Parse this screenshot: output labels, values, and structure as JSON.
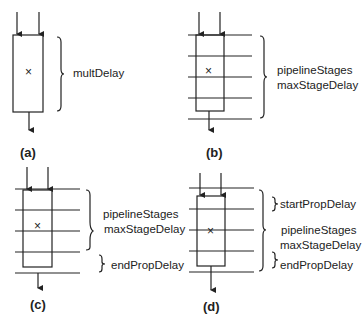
{
  "panels": [
    {
      "id": "a",
      "caption": "(a)",
      "labels": {
        "main": "multDelay"
      },
      "operator": "×",
      "pipeline_lines": 0
    },
    {
      "id": "b",
      "caption": "(b)",
      "labels": {
        "line1": "pipelineStages",
        "line2": "maxStageDelay"
      },
      "operator": "×",
      "pipeline_lines": 5
    },
    {
      "id": "c",
      "caption": "(c)",
      "labels": {
        "line1": "pipelineStages",
        "line2": "maxStageDelay",
        "end": "endPropDelay"
      },
      "operator": "×",
      "pipeline_lines": 5
    },
    {
      "id": "d",
      "caption": "(d)",
      "labels": {
        "start": "startPropDelay",
        "line1": "pipelineStages",
        "line2": "maxStageDelay",
        "end": "endPropDelay"
      },
      "operator": "×",
      "pipeline_lines": 5
    }
  ],
  "colors": {
    "stroke": "#222222",
    "background": "#ffffff"
  }
}
